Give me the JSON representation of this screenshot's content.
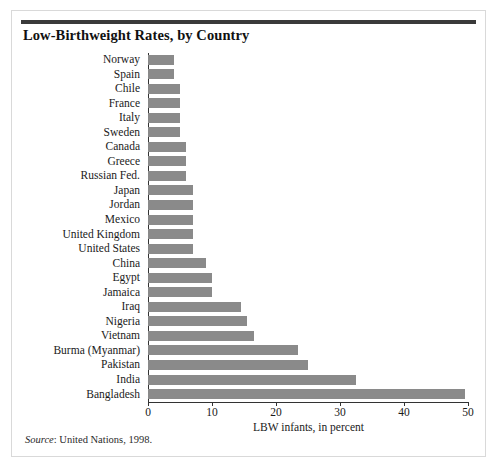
{
  "figure": {
    "title": "Low-Birthweight Rates, by Country",
    "source_label": "Source",
    "source_text": ": United Nations, 1998."
  },
  "chart_data": {
    "type": "bar",
    "orientation": "horizontal",
    "title": "Low-Birthweight Rates, by Country",
    "xlabel": "LBW infants, in percent",
    "ylabel": "",
    "xlim": [
      0,
      50
    ],
    "xticks": [
      0,
      10,
      20,
      30,
      40,
      50
    ],
    "xtick_labels": [
      "0",
      "10",
      "20",
      "30",
      "40",
      "50"
    ],
    "grid": false,
    "legend": false,
    "bar_color": "#8a8a8a",
    "categories": [
      "Norway",
      "Spain",
      "Chile",
      "France",
      "Italy",
      "Sweden",
      "Canada",
      "Greece",
      "Russian Fed.",
      "Japan",
      "Jordan",
      "Mexico",
      "United Kingdom",
      "United States",
      "China",
      "Egypt",
      "Jamaica",
      "Iraq",
      "Nigeria",
      "Vietnam",
      "Burma (Myanmar)",
      "Pakistan",
      "India",
      "Bangladesh"
    ],
    "values": [
      4,
      4,
      5,
      5,
      5,
      5,
      6,
      6,
      6,
      7,
      7,
      7,
      7,
      7,
      9,
      10,
      10,
      14.5,
      15.5,
      16.5,
      23.5,
      25,
      32.5,
      49.5
    ],
    "series": [
      {
        "name": "LBW infants, in percent",
        "values": [
          4,
          4,
          5,
          5,
          5,
          5,
          6,
          6,
          6,
          7,
          7,
          7,
          7,
          7,
          9,
          10,
          10,
          14.5,
          15.5,
          16.5,
          23.5,
          25,
          32.5,
          49.5
        ]
      }
    ]
  }
}
